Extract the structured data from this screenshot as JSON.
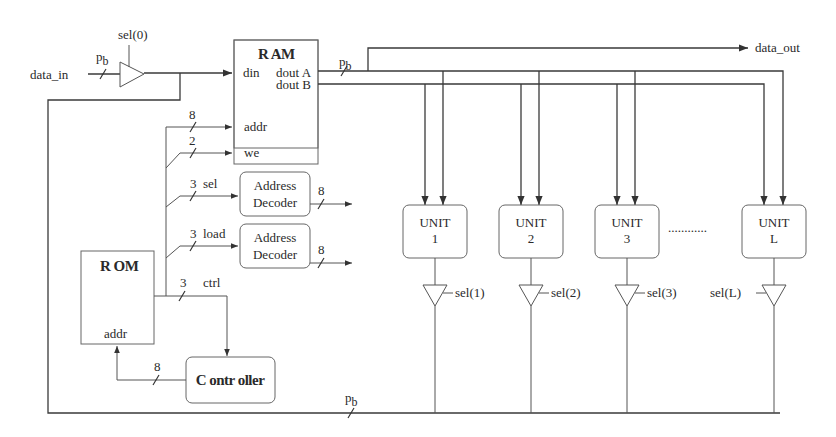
{
  "diagram": {
    "type": "block-diagram",
    "inputs": {
      "data_in": "data_in",
      "data_in_width": "p",
      "data_in_width_sub": "b"
    },
    "outputs": {
      "data_out": "data_out"
    },
    "input_buffer": {
      "select": "sel(0)"
    },
    "ram": {
      "title": "R AM",
      "ports": {
        "din": "din",
        "dout_a": "dout A",
        "dout_b": "dout B",
        "addr": "addr",
        "we": "we"
      },
      "dout_width": "p",
      "dout_width_sub": "b"
    },
    "control_signals": [
      {
        "name": "addr",
        "width": "8"
      },
      {
        "name": "we",
        "width": "2"
      },
      {
        "name": "sel",
        "width": "3"
      },
      {
        "name": "load",
        "width": "3"
      },
      {
        "name": "ctrl",
        "width": "3"
      }
    ],
    "address_decoders": [
      {
        "line1": "Address",
        "line2": "Decoder",
        "out_width": "8"
      },
      {
        "line1": "Address",
        "line2": "Decoder",
        "out_width": "8"
      }
    ],
    "rom": {
      "title": "R OM",
      "addr": "addr"
    },
    "controller": {
      "title": "C ontr oller",
      "addr_width": "8"
    },
    "units": [
      {
        "label": "UNIT",
        "index": "1",
        "select": "sel(1)"
      },
      {
        "label": "UNIT",
        "index": "2",
        "select": "sel(2)"
      },
      {
        "label": "UNIT",
        "index": "3",
        "select": "sel(3)"
      },
      {
        "label": "UNIT",
        "index": "L",
        "select": "sel(L)"
      }
    ],
    "ellipsis": "............",
    "feedback_bus": {
      "width": "p",
      "width_sub": "b"
    }
  }
}
